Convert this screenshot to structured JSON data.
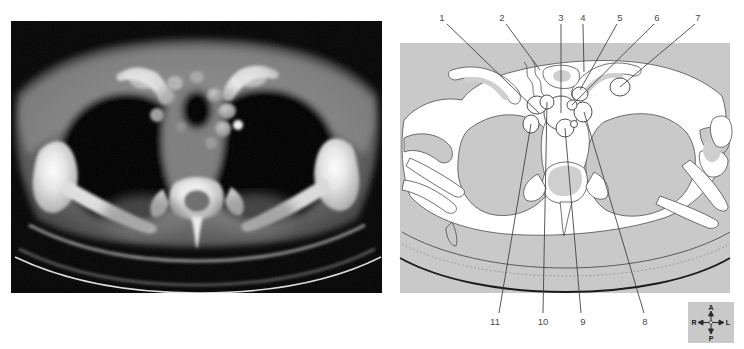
{
  "figure": {
    "panels": {
      "ct": {
        "name": "CT image",
        "modality": "CT",
        "plane": "axial"
      },
      "diagram": {
        "name": "Line drawing key"
      }
    }
  },
  "diagram": {
    "labels_top": [
      {
        "id": "1",
        "text": "1",
        "x": 442,
        "y": 18,
        "leader": {
          "x1": 447,
          "y1": 24,
          "x2": 539,
          "y2": 113
        }
      },
      {
        "id": "2",
        "text": "2",
        "x": 502,
        "y": 18,
        "leader": {
          "x1": 506,
          "y1": 24,
          "x2": 540,
          "y2": 70
        }
      },
      {
        "id": "3",
        "text": "3",
        "x": 561,
        "y": 18,
        "leader": {
          "x1": 561,
          "y1": 24,
          "x2": 561,
          "y2": 113
        }
      },
      {
        "id": "4",
        "text": "4",
        "x": 583,
        "y": 18,
        "leader": {
          "x1": 583,
          "y1": 24,
          "x2": 584,
          "y2": 72
        }
      },
      {
        "id": "5",
        "text": "5",
        "x": 620,
        "y": 18,
        "leader": {
          "x1": 617,
          "y1": 24,
          "x2": 580,
          "y2": 90
        }
      },
      {
        "id": "6",
        "text": "6",
        "x": 657,
        "y": 18,
        "leader": {
          "x1": 654,
          "y1": 24,
          "x2": 582,
          "y2": 106
        }
      },
      {
        "id": "7",
        "text": "7",
        "x": 698,
        "y": 18,
        "leader": {
          "x1": 695,
          "y1": 24,
          "x2": 620,
          "y2": 87
        }
      }
    ],
    "labels_bottom": [
      {
        "id": "11",
        "text": "11",
        "x": 495,
        "y": 322,
        "leader": {
          "x1": 499,
          "y1": 313,
          "x2": 535,
          "y2": 112
        }
      },
      {
        "id": "10",
        "text": "10",
        "x": 543,
        "y": 322,
        "leader": {
          "x1": 543,
          "y1": 313,
          "x2": 548,
          "y2": 100
        }
      },
      {
        "id": "9",
        "text": "9",
        "x": 583,
        "y": 322,
        "leader": {
          "x1": 581,
          "y1": 313,
          "x2": 565,
          "y2": 125
        }
      },
      {
        "id": "8",
        "text": "8",
        "x": 645,
        "y": 322,
        "leader": {
          "x1": 644,
          "y1": 313,
          "x2": 584,
          "y2": 112
        }
      }
    ]
  },
  "compass": {
    "name": "orientation-compass",
    "anterior": "A",
    "posterior": "P",
    "right": "R",
    "left": "L"
  },
  "colors": {
    "panel_background": "#ffffff",
    "diagram_soft_tissue": "#c9c9c9",
    "diagram_fill_white": "#ffffff",
    "diagram_bone_shade": "#cfcfcf",
    "diagram_outline": "#4d4d4d",
    "leader_line": "#3c3c3c",
    "label_text": "#4a4a4a",
    "ct_background": "#050505",
    "compass_background": "#c9c9c9"
  }
}
